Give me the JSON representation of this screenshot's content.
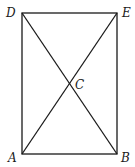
{
  "diagram": {
    "type": "rectangle-with-diagonals",
    "points": {
      "A": {
        "label": "A",
        "x": 22,
        "y": 154,
        "lx": 8,
        "ly": 162
      },
      "B": {
        "label": "B",
        "x": 117,
        "y": 154,
        "lx": 121,
        "ly": 162
      },
      "C": {
        "label": "C",
        "x": 69.5,
        "y": 84,
        "lx": 75,
        "ly": 89
      },
      "D": {
        "label": "D",
        "x": 22,
        "y": 13,
        "lx": 6,
        "ly": 17
      },
      "E": {
        "label": "E",
        "x": 117,
        "y": 13,
        "lx": 122,
        "ly": 17
      }
    },
    "segments": [
      [
        "A",
        "B"
      ],
      [
        "B",
        "E"
      ],
      [
        "E",
        "D"
      ],
      [
        "D",
        "A"
      ],
      [
        "A",
        "E"
      ],
      [
        "D",
        "B"
      ]
    ],
    "colors": {
      "stroke": "#1a1a1a",
      "background": "#ffffff"
    }
  }
}
